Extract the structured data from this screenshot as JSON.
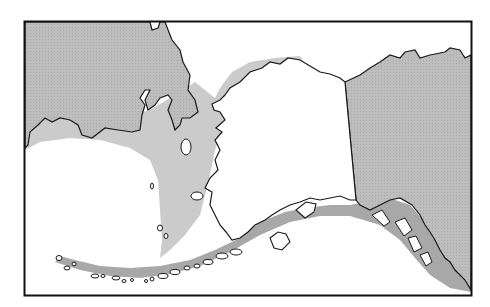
{
  "map": {
    "region": "Alaska and surrounding regions",
    "frame": {
      "x": 24,
      "y": 21,
      "width": 448,
      "height": 275
    },
    "colors": {
      "background": "#ffffff",
      "land_other": "#b8b8b8",
      "range_light": "#c8c8c8",
      "range_dark": "#a6a6a6",
      "coastline": "#1a1a1a",
      "frame": "#111111"
    },
    "areas": [
      {
        "name": "russia-chukotka",
        "fill": "land_other"
      },
      {
        "name": "canada-yukon",
        "fill": "land_other"
      },
      {
        "name": "alaska-mainland",
        "fill": "background"
      },
      {
        "name": "bering-sea-range",
        "fill": "range_light"
      },
      {
        "name": "arctic-coast-range",
        "fill": "range_light"
      },
      {
        "name": "gulf-of-alaska-range",
        "fill": "range_dark"
      },
      {
        "name": "aleutian-range",
        "fill": "range_dark"
      }
    ]
  }
}
